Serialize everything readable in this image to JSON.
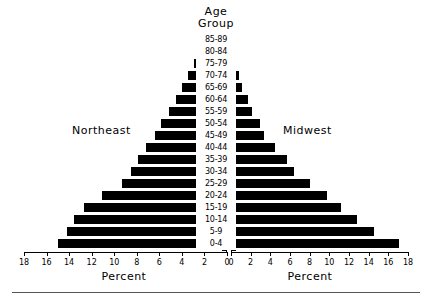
{
  "chart_data": {
    "type": "bar",
    "subtype": "population-pyramid",
    "title": "Age Group",
    "title_lines": [
      "Age",
      "Group"
    ],
    "xlabel": "Percent",
    "ylabel": "Age Group",
    "grid": false,
    "legend_position": "in-plot",
    "xlim_left": [
      0,
      18
    ],
    "xlim_right": [
      0,
      18
    ],
    "tick_labels_left": [
      "18",
      "16",
      "14",
      "12",
      "10",
      "8",
      "6",
      "4",
      "2",
      "0"
    ],
    "tick_labels_right": [
      "0",
      "2",
      "4",
      "6",
      "8",
      "10",
      "12",
      "14",
      "16",
      "18"
    ],
    "tick_values": [
      18,
      16,
      14,
      12,
      10,
      8,
      6,
      4,
      2,
      0
    ],
    "categories": [
      "85-89",
      "80-84",
      "75-79",
      "70-74",
      "65-69",
      "60-64",
      "55-59",
      "50-54",
      "45-49",
      "40-44",
      "35-39",
      "30-34",
      "25-29",
      "20-24",
      "15-19",
      "10-14",
      "5-9",
      "0-4"
    ],
    "series": [
      {
        "name": "Northeast",
        "side": "left",
        "values": [
          0.1,
          0.7,
          1.0,
          1.5,
          2.0,
          2.6,
          3.2,
          3.9,
          4.4,
          5.2,
          5.9,
          6.6,
          7.4,
          9.1,
          10.7,
          11.6,
          12.2,
          13.0
        ]
      },
      {
        "name": "Midwest",
        "side": "right",
        "values": [
          0.1,
          0.3,
          0.4,
          0.7,
          1.0,
          1.6,
          2.0,
          2.8,
          3.3,
          4.4,
          5.6,
          6.3,
          7.9,
          9.7,
          11.1,
          12.7,
          14.4,
          17.0
        ]
      }
    ],
    "axis_labels": {
      "left_percent": "Percent",
      "right_percent": "Percent"
    },
    "colors": {
      "bar": "#000000",
      "axis": "#000000",
      "background": "#ffffff",
      "rule": "#555555"
    }
  }
}
